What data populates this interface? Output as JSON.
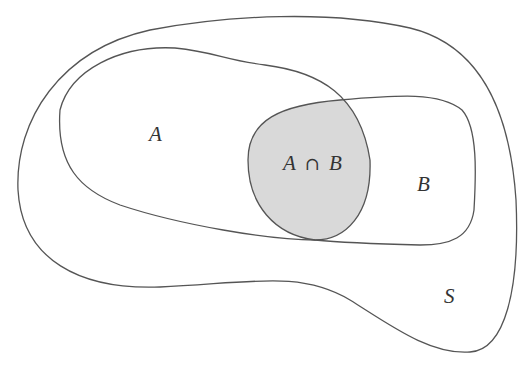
{
  "diagram": {
    "type": "venn",
    "universe": {
      "label": "S"
    },
    "sets": [
      {
        "label": "A"
      },
      {
        "label": "B"
      }
    ],
    "intersection": {
      "left": "A",
      "operator": "∩",
      "right": "B",
      "fill_color": "#d9d9d9"
    },
    "outline_color": "#555555",
    "background_color": "#ffffff"
  }
}
